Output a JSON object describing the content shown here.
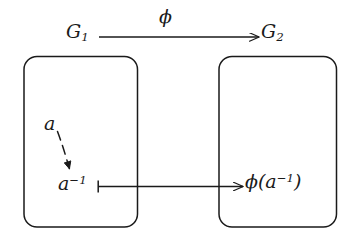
{
  "diagram": {
    "kind": "commutative-mapping-diagram",
    "stroke_color": "#1a1a1a",
    "background_color": "#ffffff",
    "domain_box": {
      "label": "G",
      "label_subscript": "1",
      "elements": [
        {
          "name": "a",
          "label": "a"
        },
        {
          "name": "a-inverse",
          "label": "a",
          "superscript": "−1"
        }
      ]
    },
    "codomain_box": {
      "label": "G",
      "label_subscript": "2",
      "elements": [
        {
          "name": "phi-of-a-inverse",
          "prefix": "ϕ(a",
          "superscript": "−1",
          "suffix": ")"
        }
      ]
    },
    "map_arrow": {
      "label": "ϕ",
      "from": "G1",
      "to": "G2"
    },
    "element_arrow": {
      "type": "maps-to",
      "from": "a⁻¹",
      "to": "ϕ(a⁻¹)"
    },
    "inverse_arrow": {
      "type": "dashed-curved",
      "from": "a",
      "to": "a⁻¹"
    }
  }
}
